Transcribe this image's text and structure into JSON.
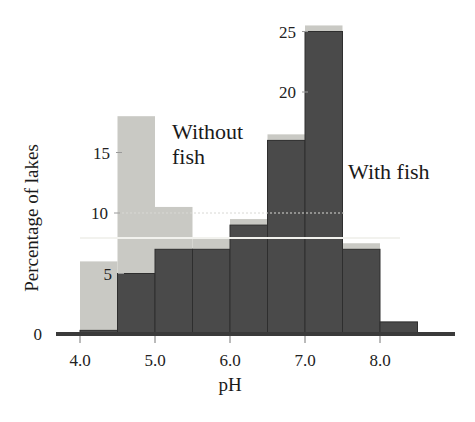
{
  "chart_data": {
    "type": "bar",
    "title": "",
    "subtitle": "",
    "xlabel": "pH",
    "ylabel": "Percentage of  lakes",
    "xlim": [
      3.75,
      8.75
    ],
    "ylim": [
      0,
      27
    ],
    "grid": false,
    "legend_position": "inline-annotation",
    "xtick_labels": [
      "4.0",
      "5.0",
      "6.0",
      "7.0",
      "8.0"
    ],
    "xtick_values": [
      4.0,
      5.0,
      6.0,
      7.0,
      8.0
    ],
    "ytick_labels": [
      "0",
      "5",
      "10",
      "15",
      "20",
      "25"
    ],
    "ytick_values": [
      0,
      5,
      10,
      15,
      20,
      25
    ],
    "bin_width": 0.5,
    "bin_starts": [
      4.0,
      4.5,
      5.0,
      5.5,
      6.0,
      6.5,
      7.0,
      7.5,
      8.0
    ],
    "bin_labels": [
      "4.0-4.5",
      "4.5-5.0",
      "5.0-5.5",
      "5.5-6.0",
      "6.0-6.5",
      "6.5-7.0",
      "7.0-7.5",
      "7.5-8.0",
      "8.0-8.5"
    ],
    "series": [
      {
        "name": "Without fish",
        "color": "#c9c9c4",
        "values": [
          6.0,
          18.0,
          10.5,
          8.0,
          9.5,
          16.5,
          25.5,
          7.5,
          0.0
        ]
      },
      {
        "name": "With fish",
        "color": "#4a4a4a",
        "values": [
          0.3,
          5.0,
          7.0,
          7.0,
          9.0,
          16.0,
          25.0,
          7.0,
          1.0
        ]
      }
    ],
    "annotations": [
      {
        "text": "Without",
        "text2": "fish",
        "x": 5.0,
        "y": 17.5
      },
      {
        "text": "With fish",
        "x": 7.9,
        "y": 14.0
      }
    ]
  },
  "axes": {
    "y_title": "Percentage of  lakes",
    "x_title": "pH",
    "y_ticks": [
      {
        "label": "0",
        "value": 0
      },
      {
        "label": "5",
        "value": 5
      },
      {
        "label": "10",
        "value": 10
      },
      {
        "label": "15",
        "value": 15
      },
      {
        "label": "20",
        "value": 20
      },
      {
        "label": "25",
        "value": 25
      }
    ],
    "x_ticks": [
      {
        "label": "4.0",
        "value": 4.0
      },
      {
        "label": "5.0",
        "value": 5.0
      },
      {
        "label": "6.0",
        "value": 6.0
      },
      {
        "label": "7.0",
        "value": 7.0
      },
      {
        "label": "8.0",
        "value": 8.0
      }
    ]
  },
  "labels": {
    "without_fish_line1": "Without",
    "without_fish_line2": "fish",
    "with_fish": "With fish"
  },
  "colors": {
    "without_fish": "#c9c9c4",
    "with_fish": "#4a4a4a",
    "axis": "#3a3a3a",
    "background": "#ffffff",
    "text": "#1a1a1a"
  }
}
